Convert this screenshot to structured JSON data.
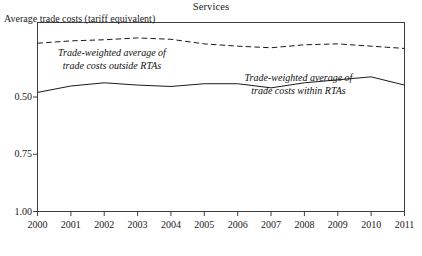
{
  "chart": {
    "title": "Services",
    "ylabel_top": "Average trade costs (tariff equivalent)",
    "annotations": {
      "outside_line1": "Trade-weighted average of",
      "outside_line2": "trade costs outside RTAs",
      "within_line1": "Trade-weighted average of",
      "within_line2": "trade costs within RTAs"
    },
    "y_ticks": [
      "1.00",
      "0.75",
      "0.50"
    ],
    "x_ticks": [
      "2000",
      "2001",
      "2002",
      "2003",
      "2004",
      "2005",
      "2006",
      "2007",
      "2008",
      "2009",
      "2010",
      "2011"
    ],
    "colors": {
      "axis": "#2b2b2b",
      "line_outside": "#1a1a1a",
      "line_within": "#1a1a1a",
      "background": "#ffffff"
    }
  },
  "chart_data": {
    "type": "line",
    "title": "Services",
    "xlabel": "",
    "ylabel": "Average trade costs (tariff equivalent)",
    "x": [
      2000,
      2001,
      2002,
      2003,
      2004,
      2005,
      2006,
      2007,
      2008,
      2009,
      2010,
      2011
    ],
    "xlim": [
      2000,
      2011
    ],
    "ylim": [
      0.5,
      1.3
    ],
    "y_ticks": [
      0.5,
      0.75,
      1.0
    ],
    "grid": false,
    "legend": "inline annotations",
    "series": [
      {
        "name": "Trade-weighted average of trade costs outside RTAs",
        "style": "dashed",
        "values": [
          1.235,
          1.245,
          1.25,
          1.258,
          1.252,
          1.232,
          1.222,
          1.215,
          1.228,
          1.232,
          1.222,
          1.212
        ]
      },
      {
        "name": "Trade-weighted average of trade costs within RTAs",
        "style": "solid",
        "values": [
          1.02,
          1.048,
          1.062,
          1.052,
          1.046,
          1.058,
          1.058,
          1.04,
          1.062,
          1.075,
          1.088,
          1.052
        ]
      }
    ]
  }
}
